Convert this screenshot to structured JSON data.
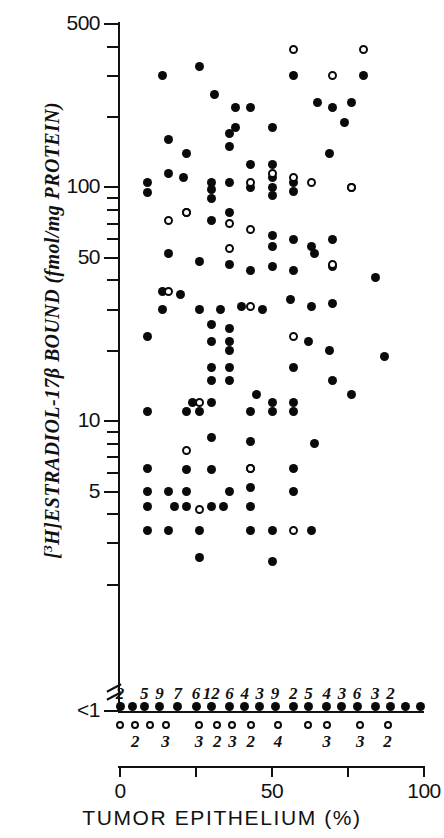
{
  "figure": {
    "x_axis_title": "TUMOR EPITHELIUM (%)",
    "y_axis_title_html": "[3H]ESTRADIOL-17β BOUND (fmol/mg PROTEIN)"
  },
  "chart_data": {
    "type": "scatter",
    "title": "",
    "xlabel": "TUMOR EPITHELIUM (%)",
    "ylabel": "[3H]ESTRADIOL-17β BOUND (fmol/mg PROTEIN)",
    "xlim": [
      0,
      100
    ],
    "ylim": [
      1,
      500
    ],
    "yscale": "log",
    "grid": false,
    "legend": null,
    "y_axis_note": "Axis is broken below 1; all values below assay limit are plotted on the '<1' row",
    "x_ticks": [
      0,
      25,
      50,
      75,
      100
    ],
    "x_tick_labels": [
      "0",
      "50",
      "100"
    ],
    "x_tick_labels_shown_at": [
      0,
      50,
      100
    ],
    "y_tick_labels": [
      "500",
      "100",
      "50",
      "10",
      "5",
      "<1"
    ],
    "y_tick_values": [
      500,
      100,
      50,
      10,
      5,
      1
    ],
    "y_minor_ticks": [
      400,
      300,
      200,
      90,
      80,
      70,
      60,
      40,
      30,
      20,
      9,
      8,
      7,
      6,
      4,
      3,
      2
    ],
    "series": [
      {
        "name": "filled-circle",
        "marker": "filled",
        "points": [
          [
            14,
            300
          ],
          [
            26,
            330
          ],
          [
            31,
            250
          ],
          [
            38,
            220
          ],
          [
            43,
            220
          ],
          [
            38,
            180
          ],
          [
            50,
            180
          ],
          [
            57,
            300
          ],
          [
            65,
            230
          ],
          [
            70,
            220
          ],
          [
            76,
            230
          ],
          [
            80,
            300
          ],
          [
            74,
            190
          ],
          [
            69,
            140
          ],
          [
            36,
            170
          ],
          [
            36,
            150
          ],
          [
            43,
            125
          ],
          [
            50,
            125
          ],
          [
            16,
            160
          ],
          [
            22,
            140
          ],
          [
            9,
            105
          ],
          [
            9,
            95
          ],
          [
            36,
            105
          ],
          [
            43,
            100
          ],
          [
            50,
            110
          ],
          [
            50,
            100
          ],
          [
            50,
            92
          ],
          [
            57,
            105
          ],
          [
            57,
            96
          ],
          [
            16,
            115
          ],
          [
            21,
            110
          ],
          [
            30,
            105
          ],
          [
            30,
            98
          ],
          [
            30,
            90
          ],
          [
            22,
            78
          ],
          [
            30,
            72
          ],
          [
            36,
            78
          ],
          [
            50,
            62
          ],
          [
            50,
            56
          ],
          [
            57,
            60
          ],
          [
            63,
            56
          ],
          [
            70,
            60
          ],
          [
            76,
            100
          ],
          [
            16,
            52
          ],
          [
            26,
            48
          ],
          [
            36,
            47
          ],
          [
            43,
            44
          ],
          [
            50,
            46
          ],
          [
            57,
            44
          ],
          [
            64,
            52
          ],
          [
            70,
            46
          ],
          [
            84,
            41
          ],
          [
            14,
            36
          ],
          [
            20,
            35
          ],
          [
            14,
            30
          ],
          [
            26,
            30
          ],
          [
            33,
            30
          ],
          [
            40,
            31
          ],
          [
            47,
            30
          ],
          [
            56,
            33
          ],
          [
            63,
            31
          ],
          [
            70,
            32
          ],
          [
            9,
            23
          ],
          [
            30,
            26
          ],
          [
            36,
            25
          ],
          [
            30,
            22
          ],
          [
            36,
            22
          ],
          [
            36,
            20
          ],
          [
            62,
            22
          ],
          [
            69,
            20
          ],
          [
            30,
            17
          ],
          [
            36,
            17
          ],
          [
            57,
            17
          ],
          [
            30,
            15
          ],
          [
            36,
            15
          ],
          [
            70,
            15
          ],
          [
            45,
            13
          ],
          [
            76,
            13
          ],
          [
            24,
            12
          ],
          [
            30,
            12
          ],
          [
            50,
            12
          ],
          [
            57,
            12
          ],
          [
            87,
            19
          ],
          [
            9,
            11
          ],
          [
            22,
            11
          ],
          [
            26,
            11
          ],
          [
            43,
            11
          ],
          [
            50,
            11
          ],
          [
            57,
            11
          ],
          [
            30,
            8.5
          ],
          [
            43,
            8.2
          ],
          [
            64,
            8.0
          ],
          [
            9,
            6.3
          ],
          [
            22,
            6.2
          ],
          [
            30,
            6.2
          ],
          [
            43,
            6.3
          ],
          [
            57,
            6.3
          ],
          [
            9,
            5.0
          ],
          [
            16,
            5.0
          ],
          [
            22,
            5.0
          ],
          [
            36,
            5.0
          ],
          [
            43,
            5.2
          ],
          [
            57,
            5.0
          ],
          [
            9,
            4.3
          ],
          [
            18,
            4.3
          ],
          [
            22,
            4.3
          ],
          [
            30,
            4.3
          ],
          [
            34,
            4.3
          ],
          [
            43,
            4.3
          ],
          [
            9,
            3.4
          ],
          [
            16,
            3.4
          ],
          [
            26,
            3.4
          ],
          [
            43,
            3.4
          ],
          [
            50,
            3.4
          ],
          [
            63,
            3.4
          ],
          [
            26,
            2.6
          ],
          [
            50,
            2.5
          ]
        ]
      },
      {
        "name": "open-circle",
        "marker": "open",
        "points": [
          [
            57,
            390
          ],
          [
            80,
            390
          ],
          [
            70,
            300
          ],
          [
            43,
            105
          ],
          [
            50,
            115
          ],
          [
            57,
            110
          ],
          [
            63,
            105
          ],
          [
            76,
            100
          ],
          [
            16,
            72
          ],
          [
            22,
            78
          ],
          [
            36,
            70
          ],
          [
            43,
            66
          ],
          [
            36,
            55
          ],
          [
            70,
            47
          ],
          [
            16,
            36
          ],
          [
            43,
            31
          ],
          [
            57,
            23
          ],
          [
            26,
            12
          ],
          [
            22,
            7.5
          ],
          [
            43,
            6.3
          ],
          [
            26,
            4.2
          ],
          [
            57,
            3.4
          ]
        ]
      }
    ],
    "below_limit_row": {
      "label": "<1",
      "description": "Counts of specimens with undetectable binding, plotted as a row of filled circles (above axis) and open circles (below axis) with tally numbers",
      "filled_counts": [
        {
          "x": 0,
          "count": "2"
        },
        {
          "x": 8,
          "count": "5"
        },
        {
          "x": 13,
          "count": "9"
        },
        {
          "x": 19,
          "count": "7"
        },
        {
          "x": 25,
          "count": "6"
        },
        {
          "x": 30,
          "count": "12"
        },
        {
          "x": 36,
          "count": "6"
        },
        {
          "x": 41,
          "count": "4"
        },
        {
          "x": 46,
          "count": "3"
        },
        {
          "x": 51,
          "count": "9"
        },
        {
          "x": 57,
          "count": "2"
        },
        {
          "x": 62,
          "count": "5"
        },
        {
          "x": 68,
          "count": "4"
        },
        {
          "x": 73,
          "count": "3"
        },
        {
          "x": 78,
          "count": "6"
        },
        {
          "x": 84,
          "count": "3"
        },
        {
          "x": 89,
          "count": "2"
        }
      ],
      "filled_unlabeled_x": [
        4,
        94,
        99
      ],
      "open_counts": [
        {
          "x": 0,
          "count": ""
        },
        {
          "x": 5,
          "count": "2"
        },
        {
          "x": 10,
          "count": ""
        },
        {
          "x": 15,
          "count": "3"
        },
        {
          "x": 26,
          "count": "3"
        },
        {
          "x": 32,
          "count": "2"
        },
        {
          "x": 37,
          "count": "3"
        },
        {
          "x": 43,
          "count": "2"
        },
        {
          "x": 52,
          "count": "4"
        },
        {
          "x": 62,
          "count": ""
        },
        {
          "x": 68,
          "count": "3"
        },
        {
          "x": 79,
          "count": "3"
        },
        {
          "x": 88,
          "count": "2"
        }
      ]
    }
  }
}
